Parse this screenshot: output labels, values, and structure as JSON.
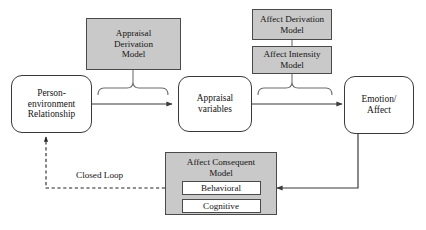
{
  "diagram": {
    "colors": {
      "gray_fill": "#c9c9c9",
      "stroke": "#3a3a3a",
      "text": "#141414",
      "white_fill": "#ffffff"
    },
    "nodes": {
      "person_environment": {
        "lines": [
          "Person-",
          "environment",
          "Relationship"
        ],
        "shape": "rounded-rect",
        "fill": "#ffffff"
      },
      "appraisal_variables": {
        "lines": [
          "Appraisal",
          "variables"
        ],
        "shape": "rounded-rect",
        "fill": "#ffffff"
      },
      "emotion_affect": {
        "lines": [
          "Emotion/",
          "Affect"
        ],
        "shape": "rounded-rect",
        "fill": "#ffffff"
      },
      "appraisal_derivation_model": {
        "lines": [
          "Appraisal",
          "Derivation",
          "Model"
        ],
        "shape": "rect",
        "fill": "#c9c9c9"
      },
      "affect_derivation_model": {
        "lines": [
          "Affect Derivation",
          "Model"
        ],
        "shape": "rect",
        "fill": "#c9c9c9"
      },
      "affect_intensity_model": {
        "lines": [
          "Affect Intensity",
          "Model"
        ],
        "shape": "rect",
        "fill": "#c9c9c9"
      },
      "affect_consequent_model": {
        "lines": [
          "Affect Consequent",
          "Model"
        ],
        "shape": "rect",
        "fill": "#c9c9c9",
        "sub_boxes": [
          {
            "label": "Behavioral"
          },
          {
            "label": "Cognitive"
          }
        ]
      }
    },
    "edges": {
      "closed_loop_label": "Closed Loop"
    }
  }
}
